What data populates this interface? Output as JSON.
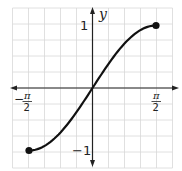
{
  "chart_data": {
    "type": "line",
    "title": "",
    "function": "y = sin(x)",
    "xlabel": "",
    "ylabel": "y",
    "x_tick_labels": [
      "-π/2",
      "π/2"
    ],
    "y_tick_labels": [
      "1",
      "-1"
    ],
    "xlim": [
      -1.5708,
      1.5708
    ],
    "ylim": [
      -1,
      1
    ],
    "grid": true,
    "legend": null,
    "endpoints": [
      {
        "x": -1.5708,
        "y": -1,
        "style": "closed-dot"
      },
      {
        "x": 1.5708,
        "y": 1,
        "style": "closed-dot"
      }
    ],
    "series": [
      {
        "name": "sin(x)",
        "x": [
          -1.5708,
          -1.1781,
          -0.7854,
          -0.3927,
          0,
          0.3927,
          0.7854,
          1.1781,
          1.5708
        ],
        "y": [
          -1,
          -0.924,
          -0.707,
          -0.383,
          0,
          0.383,
          0.707,
          0.924,
          1
        ]
      }
    ]
  },
  "labels": {
    "y_axis": "y",
    "y_pos": "1",
    "y_neg": "−1",
    "x_neg_sign": "−",
    "pi": "π",
    "two": "2"
  },
  "colors": {
    "grid": "#d8d8d8",
    "axis": "#222222",
    "curve": "#111111"
  }
}
